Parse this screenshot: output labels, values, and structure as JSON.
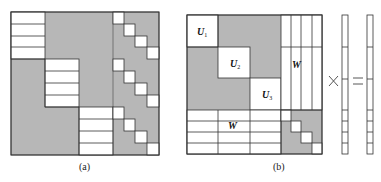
{
  "panels": {
    "a": {
      "caption": "(a)",
      "fill_color": "#b7b7b7",
      "line_color": "#333333"
    },
    "b": {
      "caption": "(b)",
      "labels": {
        "u1": "U",
        "u1_sub": "1",
        "u2": "U",
        "u2_sub": "2",
        "u3": "U",
        "u3_sub": "3",
        "w_right": "W",
        "w_bottom": "W"
      },
      "times_symbol": "×",
      "equals_symbol": "="
    }
  },
  "colors": {
    "gray": "#b7b7b7",
    "line": "#333333",
    "background": "#ffffff"
  }
}
